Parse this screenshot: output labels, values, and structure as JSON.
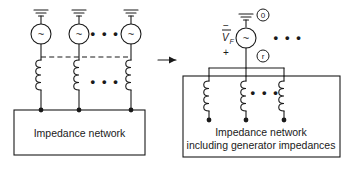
{
  "figure": {
    "title_text": "",
    "colors": {
      "ink": "#1a1a1a",
      "background": "#ffffff"
    }
  },
  "left_diagram": {
    "name": "generators-with-impedance-network",
    "ground_symbol": "earth-ground",
    "source_symbol": "~",
    "generator_count_shown": 3,
    "ellipsis": "• • •",
    "dashed_bus_label": "",
    "box_label": "Impedance network"
  },
  "transform_arrow": {
    "name": "equivalence-arrow",
    "glyph": "→"
  },
  "right_diagram": {
    "name": "thevenin-equivalent-network",
    "ground_symbol": "earth-ground",
    "source_symbol": "~",
    "voltage_label": "V",
    "voltage_subscript": "F",
    "polarity_minus": "−",
    "polarity_plus": "+",
    "node_top_label": "0",
    "node_bottom_label": "r",
    "ellipsis": "• • •",
    "coil_count_shown": 3,
    "box_label_line1": "Impedance network",
    "box_label_line2": "including generator impedances"
  }
}
